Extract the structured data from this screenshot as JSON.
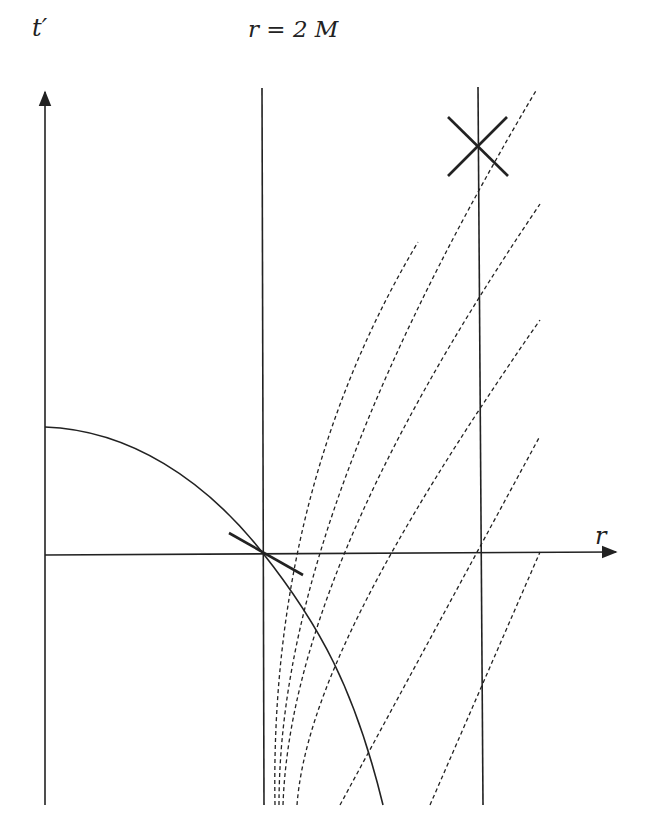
{
  "diagram": {
    "labels": {
      "vertical_axis": "t′",
      "horizontal_axis": "r",
      "horizon_line": "r = 2 M"
    },
    "elements": [
      {
        "kind": "axis",
        "name": "t-prime-axis",
        "direction": "vertical",
        "arrow": true
      },
      {
        "kind": "axis",
        "name": "r-axis",
        "direction": "horizontal",
        "arrow": true
      },
      {
        "kind": "line",
        "name": "horizon-r-2M",
        "style": "solid",
        "orientation": "vertical"
      },
      {
        "kind": "line",
        "name": "worldline-outer",
        "style": "solid",
        "orientation": "vertical"
      },
      {
        "kind": "light-cone",
        "name": "light-cone-outer",
        "style": "solid-cross"
      },
      {
        "kind": "light-cone",
        "name": "light-cone-horizon",
        "style": "solid-tangent"
      },
      {
        "kind": "curve",
        "name": "infalling-worldline",
        "style": "solid"
      },
      {
        "kind": "curves",
        "name": "ingoing-null-curves",
        "style": "dashed",
        "count": 4
      },
      {
        "kind": "lines",
        "name": "outgoing-null-lines",
        "style": "dashed",
        "count": 3
      }
    ],
    "colors": {
      "ink": "#222222",
      "background": "#ffffff"
    }
  }
}
